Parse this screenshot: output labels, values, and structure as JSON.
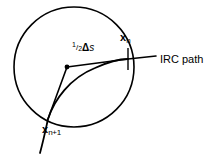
{
  "figure": {
    "name": "irc-path-circle-diagram",
    "background_color": "#ffffff",
    "stroke_color": "#000000",
    "width": 209,
    "height": 158,
    "labels": {
      "x_n": {
        "symbol": "x",
        "subscript": "n"
      },
      "x_n_plus_1": {
        "symbol": "x",
        "subscript": "n+1"
      },
      "step": {
        "numerator": "1",
        "denominator": "2",
        "delta": "Δ",
        "variable": "s"
      },
      "irc_path": "IRC path"
    },
    "geometry": {
      "circle": {
        "cx": 74,
        "cy": 67,
        "r": 60
      },
      "pivot_point": {
        "x": 67,
        "y": 67
      },
      "point_x_n": {
        "x": 128,
        "y": 59
      },
      "point_x_n_plus_1": {
        "x": 48,
        "y": 119
      },
      "tangent_line_end": {
        "x": 156,
        "y": 56
      },
      "irc_curve_tail_end": {
        "x": 40,
        "y": 153
      }
    }
  }
}
